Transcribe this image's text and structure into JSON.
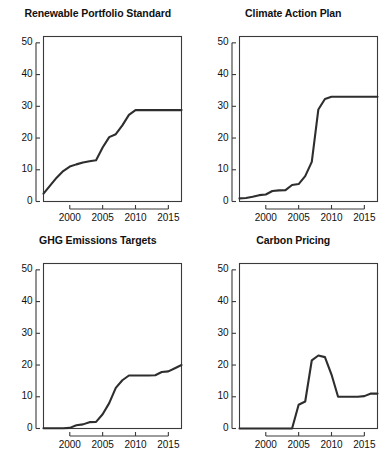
{
  "figure": {
    "layout": "2x2-grid-of-line-charts",
    "background": "#ffffff",
    "line_color": "#2e2e2e",
    "axis_color": "#3a3a3a"
  },
  "chart_data": [
    {
      "type": "line",
      "title": "Renewable Portfolio Standard",
      "xlabel": "",
      "ylabel": "",
      "xlim": [
        1996,
        2017
      ],
      "ylim": [
        0,
        52
      ],
      "xticks": [
        2000,
        2005,
        2010,
        2015
      ],
      "yticks": [
        0,
        10,
        20,
        30,
        40,
        50
      ],
      "xticklabels": [
        "2000",
        "2005",
        "2010",
        "2015"
      ],
      "yticklabels": [
        "0",
        "10",
        "20",
        "30",
        "40",
        "50"
      ],
      "grid": false,
      "legend": "none",
      "x": [
        1996,
        1997,
        1998,
        1999,
        2000,
        2001,
        2002,
        2003,
        2004,
        2005,
        2006,
        2007,
        2008,
        2009,
        2010,
        2011,
        2012,
        2013,
        2014,
        2015,
        2016,
        2017
      ],
      "values": [
        2.5,
        5.0,
        7.5,
        9.6,
        11.0,
        11.7,
        12.3,
        12.7,
        13.0,
        17.0,
        20.3,
        21.2,
        24.0,
        27.3,
        28.8,
        28.8,
        28.8,
        28.8,
        28.8,
        28.8,
        28.8,
        28.8
      ]
    },
    {
      "type": "line",
      "title": "Climate Action Plan",
      "xlabel": "",
      "ylabel": "",
      "xlim": [
        1996,
        2017
      ],
      "ylim": [
        0,
        52
      ],
      "xticks": [
        2000,
        2005,
        2010,
        2015
      ],
      "yticks": [
        0,
        10,
        20,
        30,
        40,
        50
      ],
      "xticklabels": [
        "2000",
        "2005",
        "2010",
        "2015"
      ],
      "yticklabels": [
        "0",
        "10",
        "20",
        "30",
        "40",
        "50"
      ],
      "grid": false,
      "legend": "none",
      "x": [
        1996,
        1997,
        1998,
        1999,
        2000,
        2001,
        2002,
        2003,
        2004,
        2005,
        2006,
        2007,
        2008,
        2009,
        2010,
        2011,
        2012,
        2013,
        2014,
        2015,
        2016,
        2017
      ],
      "values": [
        1.0,
        1.1,
        1.5,
        2.0,
        2.2,
        3.3,
        3.5,
        3.6,
        5.2,
        5.5,
        8.0,
        12.5,
        29.0,
        32.3,
        33.0,
        33.0,
        33.0,
        33.0,
        33.0,
        33.0,
        33.0,
        33.0
      ]
    },
    {
      "type": "line",
      "title": "GHG Emissions Targets",
      "xlabel": "",
      "ylabel": "",
      "xlim": [
        1996,
        2017
      ],
      "ylim": [
        0,
        52
      ],
      "xticks": [
        2000,
        2005,
        2010,
        2015
      ],
      "yticks": [
        0,
        10,
        20,
        30,
        40,
        50
      ],
      "xticklabels": [
        "2000",
        "2005",
        "2010",
        "2015"
      ],
      "yticklabels": [
        "0",
        "10",
        "20",
        "30",
        "40",
        "50"
      ],
      "grid": false,
      "legend": "none",
      "x": [
        1996,
        1997,
        1998,
        1999,
        2000,
        2001,
        2002,
        2003,
        2004,
        2005,
        2006,
        2007,
        2008,
        2009,
        2010,
        2011,
        2012,
        2013,
        2014,
        2015,
        2016,
        2017
      ],
      "values": [
        0.1,
        0.1,
        0.1,
        0.1,
        0.2,
        1.0,
        1.3,
        2.0,
        2.1,
        4.5,
        8.0,
        12.8,
        15.2,
        16.7,
        16.7,
        16.7,
        16.7,
        16.8,
        17.8,
        18.0,
        19.0,
        20.0
      ]
    },
    {
      "type": "line",
      "title": "Carbon Pricing",
      "xlabel": "",
      "ylabel": "",
      "xlim": [
        1996,
        2017
      ],
      "ylim": [
        0,
        52
      ],
      "xticks": [
        2000,
        2005,
        2010,
        2015
      ],
      "yticks": [
        0,
        10,
        20,
        30,
        40,
        50
      ],
      "xticklabels": [
        "2000",
        "2005",
        "2010",
        "2015"
      ],
      "yticklabels": [
        "0",
        "10",
        "20",
        "30",
        "40",
        "50"
      ],
      "grid": false,
      "legend": "none",
      "x": [
        1996,
        1997,
        1998,
        1999,
        2000,
        2001,
        2002,
        2003,
        2004,
        2005,
        2006,
        2007,
        2008,
        2009,
        2010,
        2011,
        2012,
        2013,
        2014,
        2015,
        2016,
        2017
      ],
      "values": [
        0.0,
        0.0,
        0.0,
        0.0,
        0.0,
        0.0,
        0.0,
        0.0,
        0.0,
        7.5,
        8.5,
        21.5,
        23.0,
        22.5,
        17.0,
        10.0,
        10.0,
        10.0,
        10.0,
        10.2,
        11.0,
        11.0
      ]
    }
  ]
}
